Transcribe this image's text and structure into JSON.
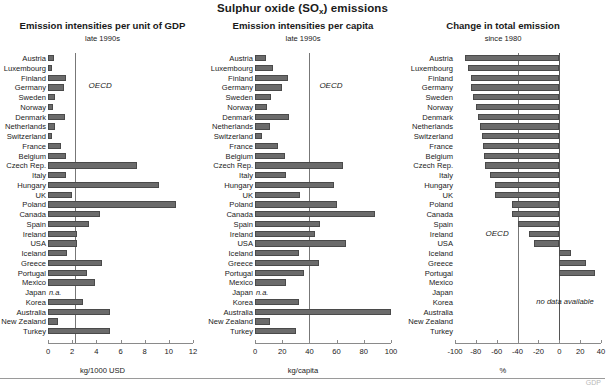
{
  "figure": {
    "main_title_prefix": "Sulphur oxide (SO",
    "main_title_sub": "x",
    "main_title_suffix": ") emissions"
  },
  "panels": {
    "gdp": {
      "title": "Emission intensities per unit of GDP",
      "subtitle": "late 1990s",
      "axis_title": "kg/1000 USD",
      "oecd_label": "OECD",
      "na_label": "n.a."
    },
    "capita": {
      "title": "Emission intensities per capita",
      "subtitle": "late 1990s",
      "axis_title": "kg/capita",
      "oecd_label": "OECD",
      "na_label": "n.a."
    },
    "change": {
      "title": "Change in total emission",
      "subtitle": "since 1980",
      "axis_title": "%",
      "oecd_label": "OECD",
      "nodata_label": "no data available"
    }
  },
  "footnote_smudge": "GDP",
  "chart_data": [
    {
      "type": "bar",
      "orientation": "horizontal",
      "title": "Emission intensities per unit of GDP",
      "subtitle": "late 1990s",
      "xlabel": "kg/1000 USD",
      "ylabel": "",
      "xlim": [
        0,
        12
      ],
      "xticks": [
        0,
        2,
        4,
        6,
        8,
        10,
        12
      ],
      "grid": false,
      "legend": "none",
      "reference_line": {
        "label": "OECD",
        "value": 2.2
      },
      "categories": [
        "Austria",
        "Luxembourg",
        "Finland",
        "Germany",
        "Sweden",
        "Norway",
        "Denmark",
        "Netherlands",
        "Switzerland",
        "France",
        "Belgium",
        "Czech Rep.",
        "Italy",
        "Hungary",
        "UK",
        "Poland",
        "Canada",
        "Spain",
        "Ireland",
        "USA",
        "Iceland",
        "Greece",
        "Portugal",
        "Mexico",
        "Japan",
        "Korea",
        "Australia",
        "New Zealand",
        "Turkey"
      ],
      "values": [
        0.5,
        0.35,
        1.45,
        1.3,
        0.55,
        0.4,
        1.4,
        0.6,
        0.3,
        1.1,
        1.5,
        7.4,
        1.5,
        9.2,
        2.0,
        10.6,
        4.3,
        3.4,
        2.4,
        2.4,
        1.6,
        4.5,
        3.2,
        3.9,
        null,
        2.9,
        5.1,
        0.8,
        5.1
      ],
      "missing": [
        "Japan"
      ]
    },
    {
      "type": "bar",
      "orientation": "horizontal",
      "title": "Emission intensities per capita",
      "subtitle": "late 1990s",
      "xlabel": "kg/capita",
      "ylabel": "",
      "xlim": [
        0,
        100
      ],
      "xticks": [
        0,
        20,
        40,
        60,
        80,
        100
      ],
      "grid": false,
      "legend": "none",
      "reference_line": {
        "label": "OECD",
        "value": 40
      },
      "categories": [
        "Austria",
        "Luxembourg",
        "Finland",
        "Germany",
        "Sweden",
        "Norway",
        "Denmark",
        "Netherlands",
        "Switzerland",
        "France",
        "Belgium",
        "Czech Rep.",
        "Italy",
        "Hungary",
        "UK",
        "Poland",
        "Canada",
        "Spain",
        "Ireland",
        "USA",
        "Iceland",
        "Greece",
        "Portugal",
        "Mexico",
        "Japan",
        "Korea",
        "Australia",
        "New Zealand",
        "Turkey"
      ],
      "values": [
        8,
        13,
        24,
        20,
        12,
        9,
        25,
        11,
        5,
        17,
        22,
        65,
        23,
        58,
        33,
        60,
        88,
        48,
        44,
        67,
        32,
        47,
        36,
        23,
        null,
        32,
        100,
        11,
        30
      ],
      "missing": [
        "Japan"
      ]
    },
    {
      "type": "bar",
      "orientation": "horizontal",
      "title": "Change in total emission",
      "subtitle": "since 1980",
      "xlabel": "%",
      "ylabel": "",
      "xlim": [
        -100,
        40
      ],
      "xticks": [
        -100,
        -80,
        -60,
        -40,
        -20,
        0,
        20,
        40
      ],
      "grid": false,
      "legend": "none",
      "reference_line": {
        "label": "OECD",
        "value": -40
      },
      "categories": [
        "Austria",
        "Luxembourg",
        "Finland",
        "Germany",
        "Sweden",
        "Norway",
        "Denmark",
        "Netherlands",
        "Switzerland",
        "France",
        "Belgium",
        "Czech Rep.",
        "Italy",
        "Hungary",
        "UK",
        "Poland",
        "Canada",
        "Spain",
        "Ireland",
        "USA",
        "Iceland",
        "Greece",
        "Portugal",
        "Mexico",
        "Japan",
        "Korea",
        "Australia",
        "New Zealand",
        "Turkey"
      ],
      "values": [
        -90,
        -88,
        -85,
        -85,
        -83,
        -80,
        -78,
        -76,
        -74,
        -73,
        -72,
        -71,
        -66,
        -62,
        -62,
        -45,
        -45,
        -40,
        -29,
        -24,
        11,
        26,
        34,
        null,
        null,
        null,
        null,
        null,
        null
      ],
      "missing": [
        "Mexico",
        "Japan",
        "Korea",
        "Australia",
        "New Zealand",
        "Turkey"
      ],
      "note": "no data available"
    }
  ]
}
